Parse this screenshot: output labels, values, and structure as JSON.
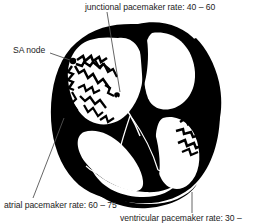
{
  "figure": {
    "background_color": "#ffffff",
    "ink_color": "#000000",
    "text_color": "#1c1c1c",
    "leader_line_color": "#555555"
  },
  "labels": {
    "junctional": "junctional pacemaker rate: 40 – 60",
    "sa_node": "SA node",
    "atrial": "atrial pacemaker rate: 60 – 75",
    "ventricular": "ventricular pacemaker rate: 30 –"
  },
  "annotations": [
    {
      "name": "junctional-pacemaker",
      "text": "junctional pacemaker rate: 40 – 60",
      "rate_low": 40,
      "rate_high": 60,
      "units": "beats per minute",
      "position": "top"
    },
    {
      "name": "sa-node",
      "text": "SA node",
      "position": "upper-left"
    },
    {
      "name": "atrial-pacemaker",
      "text": "atrial pacemaker rate: 60 – 75",
      "rate_low": 60,
      "rate_high": 75,
      "units": "beats per minute",
      "position": "bottom-left"
    },
    {
      "name": "ventricular-pacemaker",
      "text": "ventricular pacemaker rate: 30 –",
      "rate_low": 30,
      "rate_high": null,
      "units": "beats per minute",
      "position": "bottom-right",
      "truncated": true
    }
  ]
}
